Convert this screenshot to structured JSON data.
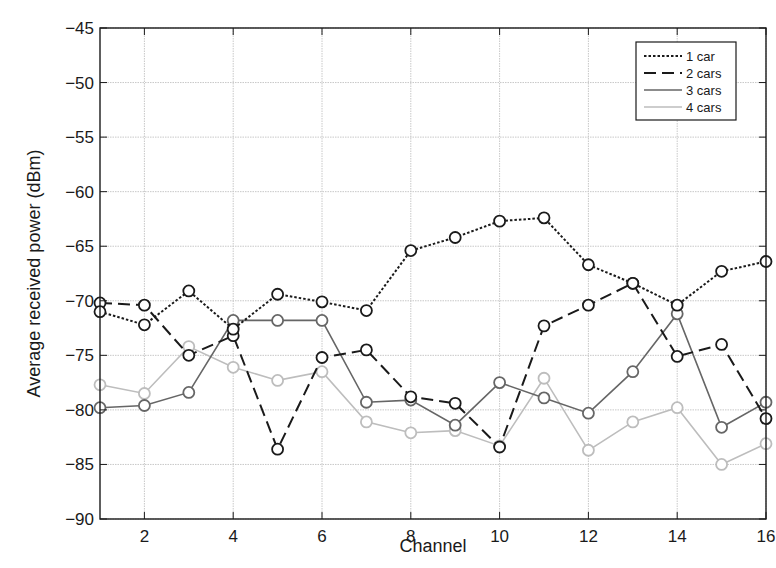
{
  "chart_data": {
    "type": "line",
    "title": "",
    "xlabel": "Channel",
    "ylabel": "Average received power (dBm)",
    "xlim": [
      1,
      16
    ],
    "ylim": [
      -90,
      -45
    ],
    "x": [
      1,
      2,
      3,
      4,
      5,
      6,
      7,
      8,
      9,
      10,
      11,
      12,
      13,
      14,
      15,
      16
    ],
    "x_ticks": [
      2,
      4,
      6,
      8,
      10,
      12,
      14,
      16
    ],
    "y_ticks": [
      -45,
      -50,
      -55,
      -60,
      -65,
      -70,
      -75,
      -80,
      -85,
      -90
    ],
    "y_tick_labels": [
      "−45",
      "−50",
      "−55",
      "−60",
      "−65",
      "−70",
      "−75",
      "−80",
      "−85",
      "−90"
    ],
    "grid": true,
    "legend_position": "upper right",
    "marker": "open circle",
    "series": [
      {
        "name": "1 car",
        "line_style": "dotted",
        "color": "#1a1a1a",
        "values": [
          -71.0,
          -72.2,
          -69.1,
          -72.6,
          -69.4,
          -70.1,
          -70.9,
          -65.4,
          -64.2,
          -62.7,
          -62.4,
          -66.7,
          -68.4,
          -70.4,
          -67.3,
          -66.4
        ]
      },
      {
        "name": "2 cars",
        "line_style": "dashed",
        "color": "#1a1a1a",
        "values": [
          -70.2,
          -70.4,
          -75.0,
          -73.2,
          -83.6,
          -75.2,
          -74.5,
          -78.8,
          -79.4,
          -83.4,
          -72.3,
          -70.4,
          -68.4,
          -75.1,
          -74.0,
          -80.8
        ]
      },
      {
        "name": "3 cars",
        "line_style": "solid",
        "color": "#666666",
        "values": [
          -79.8,
          -79.6,
          -78.4,
          -71.8,
          -71.8,
          -71.8,
          -79.3,
          -79.1,
          -81.4,
          -77.5,
          -78.9,
          -80.3,
          -76.5,
          -71.2,
          -81.6,
          -79.3
        ]
      },
      {
        "name": "4 cars",
        "line_style": "solid",
        "color": "#bdbdbd",
        "values": [
          -77.7,
          -78.5,
          -74.2,
          -76.1,
          -77.3,
          -76.5,
          -81.1,
          -82.1,
          -81.9,
          -83.3,
          -77.1,
          -83.7,
          -81.1,
          -79.8,
          -85.0,
          -83.1
        ]
      }
    ]
  }
}
